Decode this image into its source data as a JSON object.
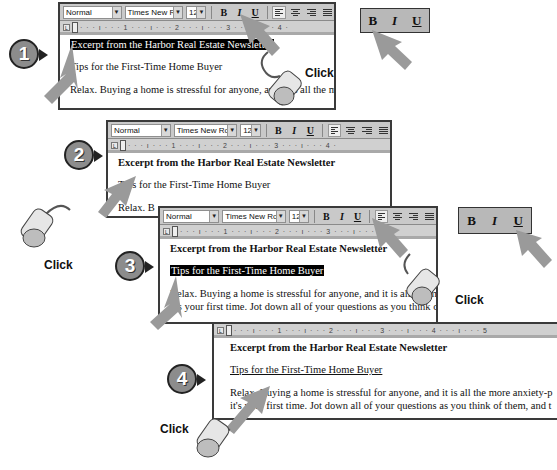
{
  "toolbar": {
    "style": "Normal",
    "font": "Times New Roman",
    "size": "12",
    "bold": "B",
    "italic": "I",
    "underline": "U",
    "dropdown_arrow": "▼"
  },
  "ruler": {
    "tab_selector": "L",
    "ticks_short": "· · · ı · · · 1 · · · ı · · · 2 · · · ı · · · 3 · · · ı · · · 4 ·",
    "ticks_long": "· · · ı · · · 1 · · · ı · · · 2 · · · ı · · · 3 · · · ı · · · 4 · · · ı · · · 5"
  },
  "document": {
    "title": "Excerpt from the Harbor Real Estate Newsletter",
    "subtitle": "Tips for the First-Time Home Buyer",
    "body_line1_short": "Relax. Buying a home is stressful for anyone, and it is all the m",
    "body_line1_step2": "Relax. B",
    "body_line1": "Relax. Buying a home is stressful for anyone, and it is all the more anxiety-p",
    "body_line2": "it's your first time. Jot down all of your questions as you think of them, and t"
  },
  "steps": [
    {
      "number": "1",
      "label": "step-1"
    },
    {
      "number": "2",
      "label": "step-2"
    },
    {
      "number": "3",
      "label": "step-3"
    },
    {
      "number": "4",
      "label": "step-4"
    }
  ],
  "biu_callout": {
    "bold": "B",
    "italic": "I",
    "underline": "U"
  },
  "click_label": "Click",
  "colors": {
    "badge_fill": "#8c8c8c",
    "arrow_fill": "#9a9a9a",
    "toolbar_bg": "#c9c9c9",
    "selection_bg": "#000000"
  }
}
